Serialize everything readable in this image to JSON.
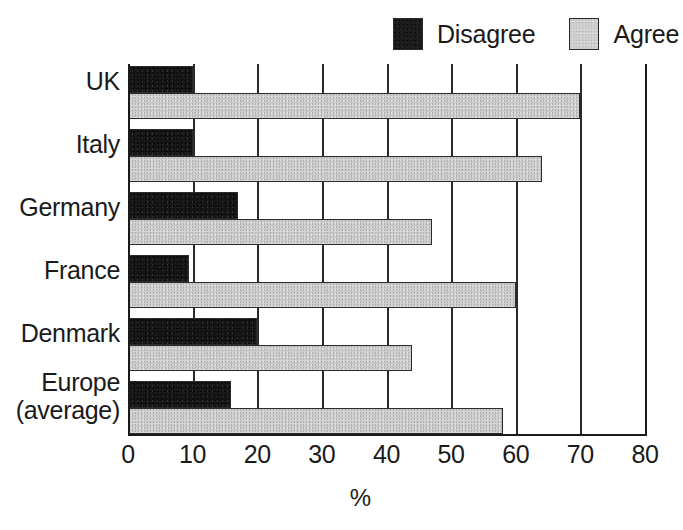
{
  "legend": {
    "entries": [
      {
        "label": "Disagree",
        "color": "#181818",
        "swatch": "dark"
      },
      {
        "label": "Agree",
        "color": "#cdcdcd",
        "swatch": "light"
      }
    ]
  },
  "chart_data": {
    "type": "bar",
    "orientation": "horizontal",
    "title": "",
    "xlabel": "%",
    "ylabel": "",
    "xlim": [
      0,
      80
    ],
    "xticks": [
      0,
      10,
      20,
      30,
      40,
      50,
      60,
      70,
      80
    ],
    "xtick_labels": [
      "0",
      "10",
      "20",
      "30",
      "40",
      "50",
      "60",
      "70",
      "80"
    ],
    "grid": true,
    "grid_axis": "x",
    "legend_position": "top-right",
    "categories": [
      "UK",
      "Italy",
      "Germany",
      "France",
      "Denmark",
      "Europe (average)"
    ],
    "category_label_lines": [
      [
        "UK"
      ],
      [
        "Italy"
      ],
      [
        "Germany"
      ],
      [
        "France"
      ],
      [
        "Denmark"
      ],
      [
        "Europe",
        "(average)"
      ]
    ],
    "series": [
      {
        "name": "Disagree",
        "color": "#181818",
        "values": [
          10,
          10,
          17,
          9.5,
          20,
          16
        ]
      },
      {
        "name": "Agree",
        "color": "#cdcdcd",
        "values": [
          70,
          64,
          47,
          60,
          44,
          58
        ]
      }
    ]
  }
}
